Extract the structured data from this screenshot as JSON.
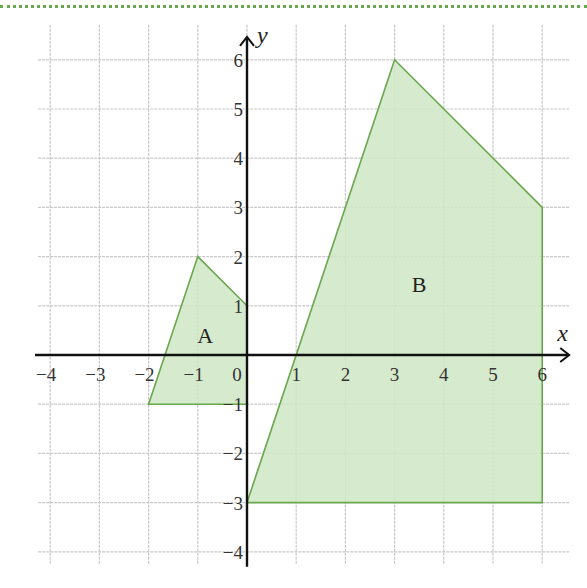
{
  "chart_data": {
    "type": "diagram",
    "title": "",
    "xlabel": "x",
    "ylabel": "y",
    "xlim": [
      -4,
      6
    ],
    "ylim": [
      -4,
      6
    ],
    "grid": true,
    "x_ticks": [
      "−4",
      "−3",
      "−2",
      "−1",
      "0",
      "1",
      "2",
      "3",
      "4",
      "5",
      "6"
    ],
    "y_ticks": [
      "6",
      "5",
      "4",
      "3",
      "2",
      "1",
      "−1",
      "−2",
      "−3",
      "−4"
    ],
    "shapes": [
      {
        "name": "A",
        "label": "A",
        "vertices": [
          [
            -1,
            2
          ],
          [
            0,
            1
          ],
          [
            0,
            -1
          ],
          [
            -2,
            -1
          ]
        ],
        "label_pos": [
          -0.85,
          0.4
        ]
      },
      {
        "name": "B",
        "label": "B",
        "vertices": [
          [
            3,
            6
          ],
          [
            6,
            3
          ],
          [
            6,
            -3
          ],
          [
            0,
            -3
          ]
        ],
        "label_pos": [
          3.5,
          1.45
        ]
      }
    ],
    "fill_color": "#cfe6c4",
    "stroke_color": "#6aa84f",
    "grid_color": "#c8c8c8",
    "axis_color": "#111111"
  }
}
